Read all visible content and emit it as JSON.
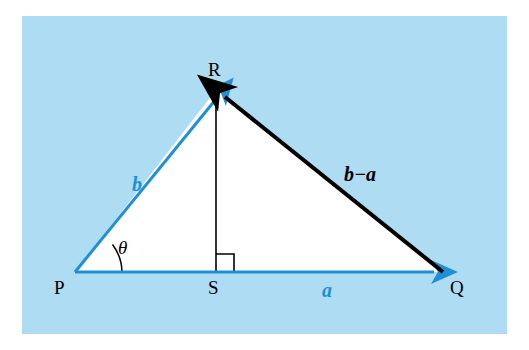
{
  "figure": {
    "type": "vector-triangle-diagram",
    "background_color": "#aedcf2",
    "interior_color": "#ffffff",
    "blue_color": "#1f8fd6",
    "black_color": "#000000",
    "vertices": [
      {
        "name": "P",
        "label": "P",
        "x": 75,
        "y": 272
      },
      {
        "name": "Q",
        "label": "Q",
        "x": 443,
        "y": 272
      },
      {
        "name": "R",
        "label": "R",
        "x": 216,
        "y": 90
      },
      {
        "name": "S",
        "label": "S",
        "x": 216,
        "y": 272
      }
    ],
    "vectors": [
      {
        "name": "vector-a",
        "label": "a",
        "color": "blue",
        "from": "P",
        "to": "Q"
      },
      {
        "name": "vector-b",
        "label": "b",
        "color": "blue",
        "from": "P",
        "to": "R"
      },
      {
        "name": "vector-b-minus-a",
        "label": "b − a",
        "color": "black",
        "from": "Q",
        "to": "R"
      }
    ],
    "labels": {
      "P": "P",
      "Q": "Q",
      "R": "R",
      "S": "S",
      "a": "a",
      "b": "b",
      "b_minus_a": "b−a",
      "theta": "θ"
    },
    "marks": {
      "right_angle_at": "S",
      "angle_theta_at": "P",
      "altitude": "R to S"
    }
  }
}
